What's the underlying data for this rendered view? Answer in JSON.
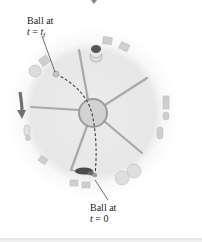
{
  "figure": {
    "type": "physics-diagram",
    "labels": {
      "ball_final": {
        "line1": "Ball at",
        "var": "t",
        "eq": " = ",
        "value": "t",
        "subscript": "f"
      },
      "ball_initial": {
        "line1": "Ball at",
        "var": "t",
        "eq": " = ",
        "value": "0"
      }
    },
    "elements": {
      "platform": {
        "shape": "disc",
        "fill": "#e9e9e9"
      },
      "hub": {
        "shape": "circle",
        "fill": "#d2d2d2",
        "stroke": "#9a9a9a"
      },
      "spokes": {
        "count": 6,
        "color": "#a8a8a8"
      },
      "trajectory": {
        "style": "dashed",
        "color": "#444444"
      },
      "rotation_arrow": {
        "direction": "down",
        "color": "#6a6a6a"
      },
      "people_icons": [
        "person-top",
        "person-bottom"
      ],
      "balls": [
        "ball-at-t-final",
        "ball-at-t-zero"
      ]
    },
    "colors": {
      "background": "#ffffff",
      "text": "#222222",
      "platform": "#e9e9e9",
      "decor": "#c8c8c8"
    }
  }
}
